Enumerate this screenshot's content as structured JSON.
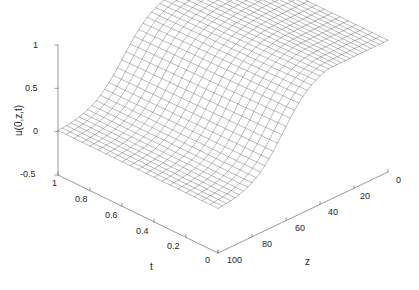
{
  "figure": {
    "type": "3d-mesh-surface",
    "background_color": "#ffffff",
    "mesh_color": "#3c3c3c",
    "axis_color": "#808080",
    "text_color": "#262626"
  },
  "axes": {
    "vertical": {
      "name": "u-axis",
      "label": "u(0,z,t)",
      "ticks": [
        "1",
        "0.5",
        "0",
        "-0.5"
      ],
      "tick_values": [
        1,
        0.5,
        0,
        -0.5
      ],
      "range": [
        -0.5,
        1
      ]
    },
    "left": {
      "name": "t-axis",
      "label": "t",
      "ticks": [
        "1",
        "0.8",
        "0.6",
        "0.4",
        "0.2",
        "0"
      ],
      "tick_values": [
        1,
        0.8,
        0.6,
        0.4,
        0.2,
        0
      ],
      "range": [
        0,
        1
      ],
      "direction": "decreasing-left-to-right"
    },
    "right": {
      "name": "z-axis",
      "label": "z",
      "ticks": [
        "100",
        "80",
        "60",
        "40",
        "20",
        "0"
      ],
      "tick_values": [
        100,
        80,
        60,
        40,
        20,
        0
      ],
      "range": [
        0,
        100
      ],
      "direction": "decreasing-left-to-right"
    }
  },
  "chart_data": {
    "type": "surface",
    "title": "",
    "xlabel": "t",
    "ylabel": "z",
    "zlabel": "u(0,z,t)",
    "xlim": [
      0,
      1
    ],
    "ylim": [
      0,
      100
    ],
    "zlim": [
      -0.5,
      1
    ],
    "xticks": [
      0,
      0.2,
      0.4,
      0.6,
      0.8,
      1
    ],
    "yticks": [
      0,
      20,
      40,
      60,
      80,
      100
    ],
    "zticks": [
      -0.5,
      0,
      0.5,
      1
    ],
    "grid": false,
    "legend": null,
    "x": [
      0,
      0.05,
      0.1,
      0.15,
      0.2,
      0.25,
      0.3,
      0.35,
      0.4,
      0.45,
      0.5,
      0.55,
      0.6,
      0.65,
      0.7,
      0.75,
      0.8,
      0.85,
      0.9,
      0.95,
      1
    ],
    "y": [
      0,
      5,
      10,
      15,
      20,
      25,
      30,
      35,
      40,
      45,
      50,
      55,
      60,
      65,
      70,
      75,
      80,
      85,
      90,
      95,
      100
    ],
    "surface_model": {
      "description": "u decays from 1 toward 0 as z increases; mild rise with t",
      "z_half_fall": 62,
      "z_steepness": 9.0,
      "t_gain": 0.07,
      "u_max": 1.0,
      "u_min": 0.0
    },
    "mesh_lines_x": 21,
    "mesh_lines_y": 41
  },
  "geometry": {
    "origin": [
      58,
      175
    ],
    "t_axis_end": [
      218,
      253
    ],
    "z_axis_end": [
      388,
      172
    ],
    "u_axis_top": [
      58,
      45
    ]
  }
}
